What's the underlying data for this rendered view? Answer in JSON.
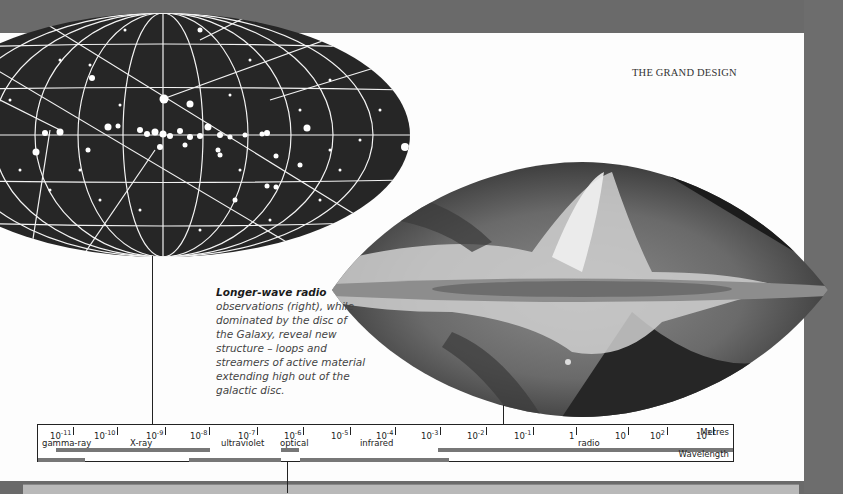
{
  "page": {
    "running_head": "THE GRAND DESIGN"
  },
  "caption": {
    "lead": "Longer-wave radio",
    "body": "observations (right), while dominated by the disc of the Galaxy, reveal new structure – loops and streamers of active material extending high out of the galactic disc."
  },
  "figures": {
    "left_map": {
      "description": "all-sky map (Aitoff projection) of discrete sources, white dots on black with coordinate grid"
    },
    "right_map": {
      "description": "all-sky radio map of the Galaxy, greyscale, showing galactic disc and loops"
    }
  },
  "scale": {
    "unit_label": "Metres",
    "axis_label": "Wavelength",
    "ticks": [
      {
        "base": "10",
        "exp": "-11"
      },
      {
        "base": "10",
        "exp": "-10"
      },
      {
        "base": "10",
        "exp": "-9"
      },
      {
        "base": "10",
        "exp": "-8"
      },
      {
        "base": "10",
        "exp": "-7"
      },
      {
        "base": "10",
        "exp": "-6"
      },
      {
        "base": "10",
        "exp": "-5"
      },
      {
        "base": "10",
        "exp": "-4"
      },
      {
        "base": "10",
        "exp": "-3"
      },
      {
        "base": "10",
        "exp": "-2"
      },
      {
        "base": "10",
        "exp": "-1"
      },
      {
        "base": "1",
        "exp": ""
      },
      {
        "base": "10",
        "exp": ""
      },
      {
        "base": "10",
        "exp": "2"
      },
      {
        "base": "10",
        "exp": "3"
      }
    ],
    "bands": [
      {
        "label": "gamma-ray"
      },
      {
        "label": "X-ray"
      },
      {
        "label": "ultraviolet"
      },
      {
        "label": "optical"
      },
      {
        "label": "infrared"
      },
      {
        "label": "radio"
      }
    ]
  },
  "colors": {
    "background": "#6a6a6a",
    "page": "#fdfdfd",
    "bar": "#777777",
    "sky_dark": "#262626"
  }
}
